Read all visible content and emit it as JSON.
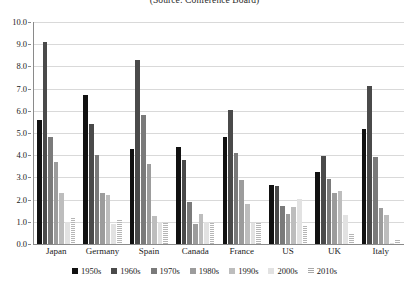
{
  "chart_data": {
    "type": "bar",
    "title": "(Source: Conference Board)",
    "xlabel": "",
    "ylabel": "",
    "ylim": [
      0.0,
      10.0
    ],
    "ytick_labels": [
      "10.0",
      "9.0",
      "8.0",
      "7.0",
      "6.0",
      "5.0",
      "4.0",
      "3.0",
      "2.0",
      "1.0",
      "0.0"
    ],
    "ytick_values": [
      10.0,
      9.0,
      8.0,
      7.0,
      6.0,
      5.0,
      4.0,
      3.0,
      2.0,
      1.0,
      0.0
    ],
    "grid": true,
    "legend_position": "bottom",
    "categories": [
      "Japan",
      "Germany",
      "Spain",
      "Canada",
      "France",
      "US",
      "UK",
      "Italy"
    ],
    "series": [
      {
        "name": "1950s",
        "color": "#111111",
        "values": [
          5.6,
          6.7,
          4.3,
          4.35,
          4.8,
          2.65,
          3.25,
          5.2
        ]
      },
      {
        "name": "1960s",
        "color": "#4a4a4a",
        "values": [
          9.1,
          5.4,
          8.3,
          3.8,
          6.05,
          2.6,
          3.95,
          7.1
        ]
      },
      {
        "name": "1970s",
        "color": "#7a7a7a",
        "values": [
          4.8,
          4.0,
          5.8,
          1.9,
          4.1,
          1.7,
          2.95,
          3.9
        ]
      },
      {
        "name": "1980s",
        "color": "#9c9c9c",
        "values": [
          3.7,
          2.3,
          3.6,
          0.9,
          2.9,
          1.35,
          2.3,
          1.6
        ]
      },
      {
        "name": "1990s",
        "color": "#bdbdbd",
        "values": [
          2.3,
          2.2,
          1.25,
          1.35,
          1.8,
          1.65,
          2.4,
          1.3
        ]
      },
      {
        "name": "2000s",
        "color": "#e2e2e2",
        "values": [
          1.0,
          0.9,
          1.0,
          1.0,
          0.95,
          2.05,
          1.3,
          0.05
        ]
      },
      {
        "name": "2010s",
        "color": "hatch",
        "values": [
          1.15,
          1.1,
          0.95,
          0.95,
          0.95,
          0.8,
          0.45,
          0.2
        ]
      }
    ]
  }
}
